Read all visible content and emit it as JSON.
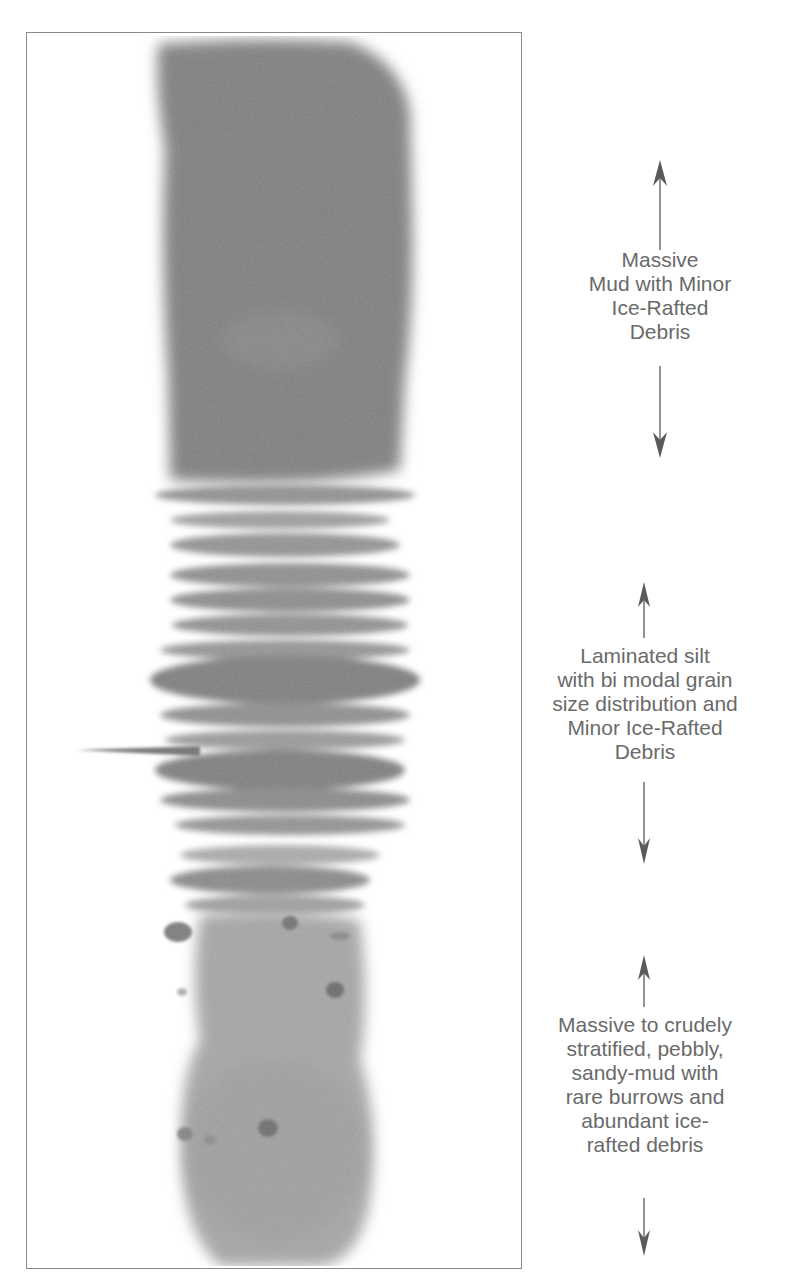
{
  "figure": {
    "units": [
      {
        "id": "upper",
        "lines": [
          "Massive",
          "Mud with Minor",
          "Ice-Rafted",
          "Debris"
        ]
      },
      {
        "id": "middle",
        "lines": [
          "Laminated silt",
          "with bi modal grain",
          "size distribution and",
          "Minor Ice-Rafted",
          "Debris"
        ]
      },
      {
        "id": "lower",
        "lines": [
          "Massive to crudely",
          "stratified, pebbly,",
          "sandy-mud with",
          "rare burrows and",
          "abundant ice-",
          "rafted debris"
        ]
      }
    ],
    "colors": {
      "frame": "#8a8a8a",
      "label_text": "#6a6a6a",
      "arrow": "#5a5a5a",
      "core_dark": "#707070",
      "core_mid": "#8c8c8c",
      "core_light": "#b5b5b5"
    }
  }
}
